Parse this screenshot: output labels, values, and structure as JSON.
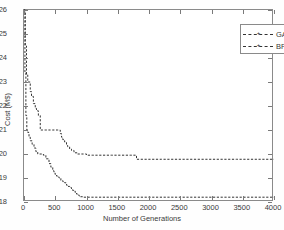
{
  "chart_data": {
    "type": "line",
    "title": "",
    "xlabel": "Number of Generations",
    "ylabel": "Cost (M$)",
    "xlim": [
      0,
      4000
    ],
    "ylim": [
      18,
      26
    ],
    "xticks": [
      0,
      500,
      1000,
      1500,
      2000,
      2500,
      3000,
      3500,
      4000
    ],
    "yticks": [
      18,
      19,
      20,
      21,
      22,
      23,
      24,
      25,
      26
    ],
    "grid": false,
    "legend_position": "upper-right",
    "line_style": "dashed",
    "marker": "plus",
    "series": [
      {
        "name": "GA",
        "color": "#333333",
        "x": [
          0,
          20,
          40,
          60,
          80,
          100,
          120,
          150,
          180,
          200,
          230,
          260,
          300,
          340,
          380,
          420,
          460,
          500,
          540,
          580,
          600,
          620,
          650,
          680,
          700,
          730,
          760,
          800,
          850,
          900,
          950,
          1000,
          1100,
          1400,
          1700,
          1790,
          1800,
          2200,
          2800,
          3400,
          4000
        ],
        "y": [
          26.0,
          24.5,
          23.3,
          23.0,
          23.0,
          22.6,
          22.4,
          22.1,
          21.9,
          21.8,
          21.6,
          21.0,
          21.0,
          21.0,
          21.0,
          21.0,
          21.0,
          21.0,
          21.0,
          20.85,
          20.7,
          20.6,
          20.5,
          20.35,
          20.3,
          20.2,
          20.15,
          20.05,
          20.0,
          20.0,
          20.0,
          19.95,
          19.95,
          19.95,
          19.95,
          19.95,
          19.78,
          19.78,
          19.78,
          19.78,
          19.78
        ]
      },
      {
        "name": "BFO",
        "color": "#333333",
        "x": [
          0,
          15,
          30,
          45,
          60,
          80,
          100,
          130,
          160,
          190,
          220,
          250,
          280,
          310,
          350,
          400,
          430,
          460,
          480,
          500,
          530,
          560,
          590,
          620,
          650,
          680,
          700,
          730,
          760,
          790,
          820,
          850,
          880,
          900,
          950,
          1000,
          1200,
          1600,
          2000,
          2600,
          3200,
          4000
        ],
        "y": [
          26.0,
          23.4,
          21.6,
          21.0,
          20.9,
          20.7,
          20.55,
          20.4,
          20.25,
          20.1,
          20.0,
          20.0,
          20.0,
          19.95,
          19.8,
          19.6,
          19.45,
          19.3,
          19.2,
          19.1,
          19.05,
          19.0,
          18.9,
          18.85,
          18.8,
          18.7,
          18.65,
          18.6,
          18.5,
          18.45,
          18.35,
          18.3,
          18.25,
          18.22,
          18.2,
          18.2,
          18.2,
          18.2,
          18.2,
          18.2,
          18.2,
          18.2
        ]
      }
    ]
  }
}
